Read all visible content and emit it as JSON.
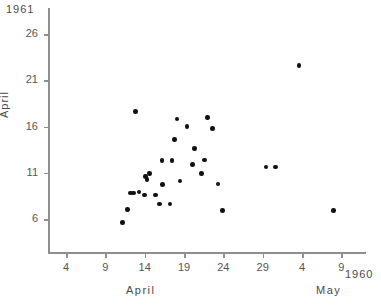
{
  "figure": {
    "corner_top_left": "1961",
    "corner_bottom_right": "1960",
    "y_axis_title": "April",
    "x_axis_title_left": "April",
    "x_axis_title_right": "May"
  },
  "chart_data": {
    "type": "scatter",
    "title": "",
    "xlabel": "April / May (1960)",
    "ylabel": "April (1961)",
    "x_tick_labels": [
      "4",
      "9",
      "14",
      "19",
      "24",
      "29",
      "4",
      "9"
    ],
    "x_tick_values": [
      4,
      9,
      14,
      19,
      24,
      29,
      34,
      39
    ],
    "x_tick_months": [
      "April",
      "April",
      "April",
      "April",
      "April",
      "April",
      "May",
      "May"
    ],
    "y_tick_labels": [
      "6",
      "11",
      "16",
      "21",
      "26"
    ],
    "y_tick_values": [
      6,
      11,
      16,
      21,
      26
    ],
    "xlim": [
      1.5,
      42
    ],
    "ylim": [
      2.5,
      29
    ],
    "grid": false,
    "legend": null,
    "marker": "filled-circle",
    "marker_color": "#111111",
    "points": [
      {
        "x": 11.2,
        "y": 5.6
      },
      {
        "x": 11.8,
        "y": 7.0
      },
      {
        "x": 12.2,
        "y": 8.8
      },
      {
        "x": 12.6,
        "y": 8.8
      },
      {
        "x": 12.8,
        "y": 17.6
      },
      {
        "x": 13.3,
        "y": 8.9
      },
      {
        "x": 14.1,
        "y": 10.6
      },
      {
        "x": 14.3,
        "y": 10.3
      },
      {
        "x": 14.6,
        "y": 10.9
      },
      {
        "x": 14.0,
        "y": 8.6
      },
      {
        "x": 15.4,
        "y": 8.6
      },
      {
        "x": 15.9,
        "y": 7.6
      },
      {
        "x": 17.2,
        "y": 7.6
      },
      {
        "x": 16.2,
        "y": 12.3
      },
      {
        "x": 16.3,
        "y": 9.7
      },
      {
        "x": 17.5,
        "y": 12.3
      },
      {
        "x": 17.8,
        "y": 14.6
      },
      {
        "x": 18.1,
        "y": 16.8
      },
      {
        "x": 18.5,
        "y": 10.1
      },
      {
        "x": 19.4,
        "y": 16.0
      },
      {
        "x": 20.3,
        "y": 13.6
      },
      {
        "x": 20.1,
        "y": 11.9
      },
      {
        "x": 21.2,
        "y": 10.9
      },
      {
        "x": 21.6,
        "y": 12.4
      },
      {
        "x": 22.0,
        "y": 17.0
      },
      {
        "x": 22.6,
        "y": 15.8
      },
      {
        "x": 23.3,
        "y": 9.8
      },
      {
        "x": 23.9,
        "y": 6.9
      },
      {
        "x": 29.4,
        "y": 11.6
      },
      {
        "x": 30.6,
        "y": 11.6
      },
      {
        "x": 33.6,
        "y": 22.6
      },
      {
        "x": 38.0,
        "y": 6.9
      }
    ]
  }
}
